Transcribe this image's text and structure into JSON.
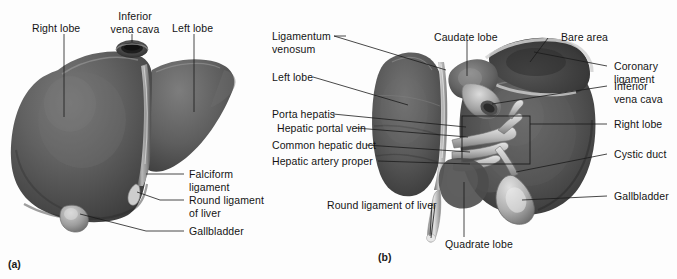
{
  "figure": {
    "background_color": "#fdfdfd",
    "ink_color": "#1b1b1b",
    "liver_tone_dark": "#3a3a3a",
    "liver_tone_mid": "#5b5b5b",
    "liver_tone_light": "#8e8e8e",
    "highlight_tone": "#cfcfcf"
  },
  "panel_a": {
    "tag": "(a)",
    "view_name": "anterior-view",
    "labels": {
      "right_lobe": "Right lobe",
      "inferior_vena_cava": "Inferior\nvena cava",
      "left_lobe": "Left lobe",
      "falciform_ligament": "Falciform\nligament",
      "round_ligament_of_liver": "Round ligament\nof liver",
      "gallbladder": "Gallbladder"
    }
  },
  "panel_b": {
    "tag": "(b)",
    "view_name": "inferior-visceral-view",
    "labels": {
      "ligamentum_venosum": "Ligamentum\nvenosum",
      "left_lobe": "Left lobe",
      "porta_hepatis": "Porta hepatis",
      "hepatic_portal_vein": "Hepatic portal vein",
      "common_hepatic_duct": "Common hepatic duct",
      "hepatic_artery_proper": "Hepatic artery proper",
      "round_ligament_of_liver": "Round ligament of liver",
      "caudate_lobe": "Caudate lobe",
      "quadrate_lobe": "Quadrate lobe",
      "bare_area": "Bare area",
      "coronary_ligament": "Coronary\nligament",
      "inferior_vena_cava": "Inferior\nvena cava",
      "right_lobe": "Right lobe",
      "cystic_duct": "Cystic duct",
      "gallbladder": "Gallbladder"
    }
  }
}
